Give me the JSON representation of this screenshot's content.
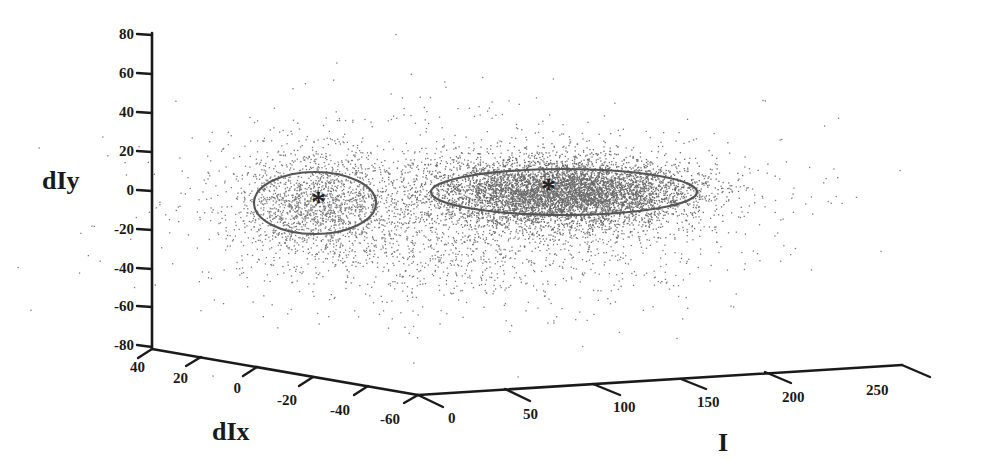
{
  "chart_data": {
    "type": "scatter",
    "subtype": "3d-scatter",
    "title": "",
    "axes": {
      "x": {
        "label": "I",
        "ticks": [
          0,
          50,
          100,
          150,
          200,
          250
        ],
        "range": [
          0,
          250
        ]
      },
      "y": {
        "label": "dIx",
        "ticks": [
          40,
          20,
          0,
          -20,
          -40,
          -60
        ],
        "range": [
          -60,
          40
        ]
      },
      "z": {
        "label": "dIy",
        "ticks": [
          80,
          60,
          40,
          20,
          0,
          -20,
          -40,
          -60,
          -80
        ],
        "range": [
          -80,
          80
        ]
      }
    },
    "grid": false,
    "legend": null,
    "clusters": [
      {
        "name": "cluster-1",
        "centroid_marker": "*",
        "approx_center_screen": [
          320,
          198
        ],
        "ellipse_screen": {
          "cx": 315,
          "cy": 203,
          "rx": 61,
          "ry": 31
        },
        "point_count": 1400,
        "spread_screen": {
          "sx": 52,
          "sy": 38
        }
      },
      {
        "name": "cluster-2",
        "centroid_marker": "*",
        "approx_center_screen": [
          550,
          186
        ],
        "ellipse_screen": {
          "cx": 564,
          "cy": 192,
          "rx": 133,
          "ry": 23
        },
        "point_count": 5200,
        "spread_screen": {
          "sx": 85,
          "sy": 30
        }
      }
    ],
    "background_scatter": {
      "point_count": 2600,
      "center_screen": [
        470,
        200
      ],
      "spread_screen": {
        "sx": 130,
        "sy": 45
      }
    }
  },
  "labels": {
    "z_axis": "dIy",
    "y_axis": "dIx",
    "x_axis": "I",
    "z_ticks": [
      "80",
      "60",
      "40",
      "20",
      "0",
      "-20",
      "-40",
      "-60",
      "-80"
    ],
    "y_ticks": [
      "40",
      "20",
      "0",
      "-20",
      "-40",
      "-60"
    ],
    "x_ticks": [
      "0",
      "50",
      "100",
      "150",
      "200",
      "250"
    ],
    "centroid_1": "*",
    "centroid_2": "*"
  },
  "colors": {
    "points": "#7a7a7a",
    "points_dense": "#6a6a6a",
    "axes": "#1a1a1a",
    "ellipse": "#555555"
  }
}
